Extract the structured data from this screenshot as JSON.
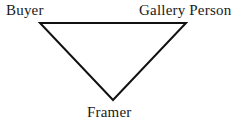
{
  "diagram": {
    "type": "triangle-relationship-diagram",
    "background_color": "#ffffff",
    "stroke_color": "#111111",
    "stroke_width": 2,
    "text_color": "#1a1a1a",
    "canvas": {
      "width": 247,
      "height": 127
    },
    "nodes": [
      {
        "id": "buyer",
        "label": "Buyer",
        "position": "top-left",
        "vertex": {
          "x": 40,
          "y": 23
        },
        "label_position": {
          "x": 6,
          "y": 2
        }
      },
      {
        "id": "gallery-person",
        "label": "Gallery Person",
        "position": "top-right",
        "vertex": {
          "x": 186,
          "y": 23
        },
        "label_position": {
          "x": 139,
          "y": 2
        }
      },
      {
        "id": "framer",
        "label": "Framer",
        "position": "bottom-center",
        "vertex": {
          "x": 113,
          "y": 100
        },
        "label_position": {
          "x": 87,
          "y": 104
        }
      }
    ],
    "edges": [
      {
        "id": "edge-buyer-gallery",
        "from": "buyer",
        "to": "gallery-person"
      },
      {
        "id": "edge-gallery-framer",
        "from": "gallery-person",
        "to": "framer"
      },
      {
        "id": "edge-framer-buyer",
        "from": "framer",
        "to": "buyer"
      }
    ],
    "triangle_points": "40,23 186,23 113,100"
  }
}
